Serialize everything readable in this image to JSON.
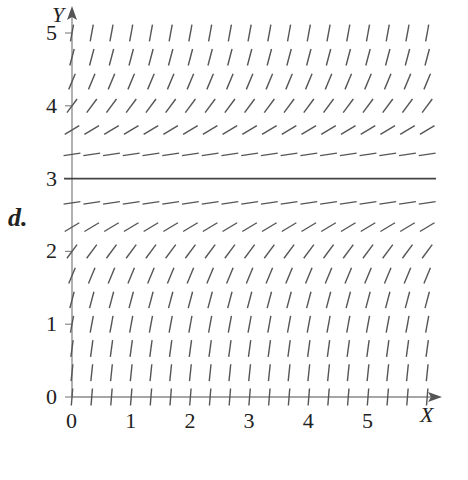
{
  "part_label": "d.",
  "axes": {
    "x_label": "X",
    "y_label": "Y",
    "x_ticks": [
      "0",
      "1",
      "2",
      "3",
      "4",
      "5"
    ],
    "y_ticks": [
      "0",
      "1",
      "2",
      "3",
      "4",
      "5"
    ],
    "xlim": [
      0,
      6
    ],
    "ylim": [
      0,
      5
    ],
    "color": "#888888"
  },
  "chart_data": {
    "type": "slope_field",
    "title": "",
    "xlabel": "X",
    "ylabel": "Y",
    "xlim": [
      0,
      6
    ],
    "ylim": [
      0,
      5
    ],
    "grid_step_x": 0.3333,
    "grid_step_y": 0.3333,
    "equilibrium_solution": {
      "y": 3,
      "style": "solid horizontal line"
    },
    "sample_slopes": [
      {
        "y": 5.0,
        "slope": "steep positive"
      },
      {
        "y": 4.0,
        "slope": "positive ~ 1.2"
      },
      {
        "y": 3.33,
        "slope": "small positive ~ 0.25"
      },
      {
        "y": 3.0,
        "slope": 0
      },
      {
        "y": 2.67,
        "slope": "small positive ~ 0.25"
      },
      {
        "y": 2.0,
        "slope": "positive ~ 1.5"
      },
      {
        "y": 0.0,
        "slope": "steep positive"
      }
    ]
  },
  "style": {
    "segment_color": "#555555",
    "line_color": "#444444"
  }
}
